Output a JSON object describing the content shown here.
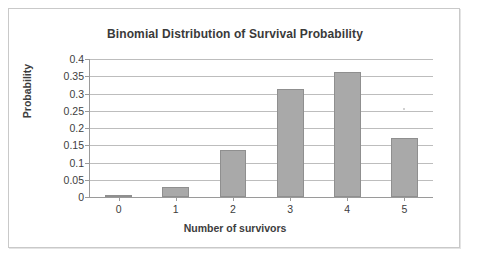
{
  "chart_data": {
    "type": "bar",
    "title": "Binomial Distribution of Survival Probability",
    "xlabel": "Number of survivors",
    "ylabel": "Probability",
    "categories": [
      "0",
      "1",
      "2",
      "3",
      "4",
      "5"
    ],
    "values": [
      0.002,
      0.029,
      0.137,
      0.312,
      0.363,
      0.171
    ],
    "ylim": [
      0,
      0.4
    ],
    "ytick_labels": [
      "0",
      "0.05",
      "0.1",
      "0.15",
      "0.2",
      "0.25",
      "0.3",
      "0.35",
      "0.4"
    ],
    "ytick_values": [
      0,
      0.05,
      0.1,
      0.15,
      0.2,
      0.25,
      0.3,
      0.35,
      0.4
    ],
    "grid": true,
    "legend": "none",
    "series_name": "Probability",
    "bar_color": "#a9a9a9",
    "bar_border_color": "#8f8f8f",
    "gridline_color": "#bdbdbd",
    "axis_color": "#9a9a9a",
    "text_color": "#3d3d3d",
    "frame_color": "#c9c9c9",
    "background": "#ffffff"
  }
}
